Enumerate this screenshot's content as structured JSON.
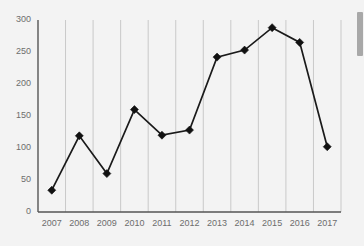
{
  "chart_data": {
    "type": "line",
    "title": "",
    "xlabel": "",
    "ylabel": "",
    "categories": [
      "2007",
      "2008",
      "2009",
      "2010",
      "2011",
      "2012",
      "2013",
      "2014",
      "2015",
      "2016",
      "2017"
    ],
    "values": [
      34,
      119,
      60,
      160,
      120,
      128,
      242,
      253,
      288,
      265,
      102
    ],
    "ylim": [
      0,
      300
    ],
    "ytick_labels": [
      "0",
      "50",
      "100",
      "150",
      "200",
      "250",
      "300"
    ],
    "ytick_values": [
      0,
      50,
      100,
      150,
      200,
      250,
      300
    ],
    "grid": "vertical",
    "legend": "none",
    "marker": "diamond",
    "line_color": "#1a1a1a",
    "marker_color": "#111111",
    "grid_color": "#c9c9c9",
    "axis_color": "#555555",
    "tick_label_color": "#6d6d6d",
    "background_color": "#f3f3f3"
  },
  "scrollbar": {
    "name": "vertical-scrollbar",
    "thumb_color": "#a8a8a8",
    "track_color": "#f3f3f3"
  }
}
